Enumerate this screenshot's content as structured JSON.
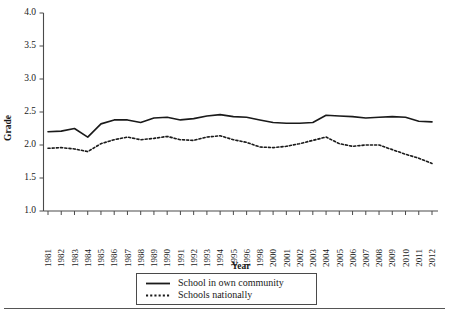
{
  "chart_data": {
    "type": "line",
    "title": "",
    "xlabel": "Year",
    "ylabel": "Grade",
    "ylim": [
      1.0,
      4.0
    ],
    "ytick_labels": [
      "1.0",
      "1.5",
      "2.0",
      "2.5",
      "3.0",
      "3.5",
      "4.0"
    ],
    "ytick_values": [
      1.0,
      1.5,
      2.0,
      2.5,
      3.0,
      3.5,
      4.0
    ],
    "grid": false,
    "legend_position": "bottom-center",
    "categories": [
      "1981",
      "1982",
      "1983",
      "1984",
      "1985",
      "1986",
      "1987",
      "1988",
      "1989",
      "1990",
      "1991",
      "1992",
      "1993",
      "1994",
      "1995",
      "1996",
      "1998",
      "2000",
      "2001",
      "2002",
      "2003",
      "2004",
      "2005",
      "2006",
      "2007",
      "2008",
      "2009",
      "2010",
      "2011",
      "2012"
    ],
    "series": [
      {
        "name": "School in own community",
        "style": "solid",
        "color": "#1a1a1a",
        "values": [
          2.2,
          2.21,
          2.25,
          2.12,
          2.32,
          2.38,
          2.38,
          2.34,
          2.41,
          2.42,
          2.38,
          2.4,
          2.44,
          2.46,
          2.43,
          2.42,
          2.38,
          2.34,
          2.33,
          2.33,
          2.34,
          2.45,
          2.44,
          2.43,
          2.41,
          2.42,
          2.43,
          2.42,
          2.36,
          2.35
        ]
      },
      {
        "name": "Schools nationally",
        "style": "dashed",
        "color": "#1a1a1a",
        "values": [
          1.95,
          1.96,
          1.94,
          1.9,
          2.02,
          2.08,
          2.12,
          2.08,
          2.1,
          2.13,
          2.08,
          2.07,
          2.12,
          2.14,
          2.08,
          2.04,
          1.97,
          1.96,
          1.98,
          2.02,
          2.07,
          2.12,
          2.02,
          1.98,
          2.0,
          2.0,
          1.93,
          1.86,
          1.8,
          1.72
        ]
      }
    ]
  },
  "legend": {
    "entries": [
      {
        "label": "School in own community",
        "style": "solid"
      },
      {
        "label": "Schools nationally",
        "style": "dashed"
      }
    ]
  }
}
